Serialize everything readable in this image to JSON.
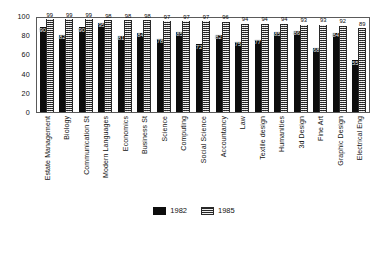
{
  "chart_data": {
    "type": "bar",
    "title": "",
    "xlabel": "",
    "ylabel": "",
    "ylim": [
      0,
      100
    ],
    "yticks": [
      0,
      20,
      40,
      60,
      80,
      100
    ],
    "grid": false,
    "legend_position": "bottom",
    "categories": [
      "Estate Management",
      "Biology",
      "Communication St",
      "Modern Languages",
      "Economics",
      "Business St",
      "Science",
      "Computing",
      "Social Science",
      "Accountancy",
      "Law",
      "Textile design",
      "Humanities",
      "3d Design",
      "Fine Art",
      "Graphic Design",
      "Electrical Eng"
    ],
    "series": [
      {
        "name": "1982",
        "color": "#0d0d0d",
        "values": [
          90,
          82,
          90,
          95,
          81,
          84,
          78,
          85,
          72,
          82,
          75,
          77,
          85,
          86,
          68,
          84,
          55
        ]
      },
      {
        "name": "1985",
        "color": "#8d8d8d",
        "values": [
          99,
          99,
          99,
          98,
          98,
          98,
          97,
          97,
          97,
          96,
          94,
          94,
          94,
          93,
          93,
          92,
          89
        ]
      }
    ]
  },
  "legend": {
    "items": [
      {
        "label": "1982",
        "swatch": "solid-black-swatch"
      },
      {
        "label": "1985",
        "swatch": "hatched-gray-swatch"
      }
    ]
  }
}
